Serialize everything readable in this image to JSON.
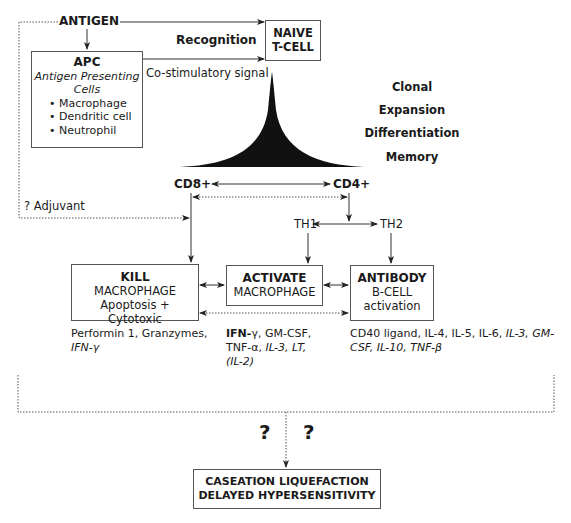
{
  "antigen": "ANTIGEN",
  "recognition": "Recognition",
  "costim": "Co-stimulatory signal",
  "naive": {
    "line1": "NAIVE",
    "line2": "T-CELL"
  },
  "apc": {
    "title": "APC",
    "subtitle1": "Antigen Presenting",
    "subtitle2": "Cells",
    "items": [
      "• Macrophage",
      "• Dendritic cell",
      "• Neutrophil"
    ]
  },
  "stages": [
    "Clonal",
    "Expansion",
    "Differentiation",
    "Memory"
  ],
  "cd8": "CD8+",
  "cd4": "CD4+",
  "adjuvant": "? Adjuvant",
  "th1": "TH1",
  "th2": "TH2",
  "kill": {
    "title": "KILL",
    "line2": "MACROPHAGE",
    "line3": "Apoptosis + Cytotoxic"
  },
  "activate": {
    "title": "ACTIVATE",
    "line2": "MACROPHAGE"
  },
  "antibody": {
    "title": "ANTIBODY",
    "line2": "B-CELL",
    "line3": "activation"
  },
  "cytokines": {
    "kill": {
      "a": "Performin 1, Granzymes,",
      "b": "IFN-γ"
    },
    "activate": {
      "ifn": "IFN-",
      "gamma": "γ, GM-CSF,",
      "tnf": "TNF-α, ",
      "il3": "IL-3, LT,",
      "il2": "(IL-2)"
    },
    "antibody": {
      "a": "CD40 ligand, IL-4, IL-5, IL-6, ",
      "il3": "IL-3, GM-",
      "b": "CSF, IL-10, TNF-β"
    }
  },
  "question_marks": [
    "?",
    "?"
  ],
  "outcome": {
    "line1": "CASEATION LIQUEFACTION",
    "line2": "DELAYED HYPERSENSITIVITY"
  }
}
